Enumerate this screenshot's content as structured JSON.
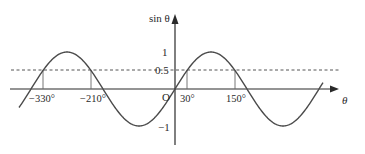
{
  "diagram": {
    "y_axis_label": "sin θ",
    "x_axis_label": "θ",
    "origin_label": "O",
    "y_ticks": [
      {
        "value": 1,
        "label": "1"
      },
      {
        "value": 0.5,
        "label": "0.5"
      },
      {
        "value": -1,
        "label": "−1"
      }
    ],
    "x_markers": [
      {
        "value": -330,
        "label": "−330°"
      },
      {
        "value": -210,
        "label": "−210°"
      },
      {
        "value": 30,
        "label": "30°"
      },
      {
        "value": 150,
        "label": "150°"
      }
    ],
    "reference_line": {
      "y": 0.5,
      "style": "dashed"
    },
    "curve": {
      "function": "sin",
      "domain_deg": [
        -390,
        370
      ]
    },
    "colors": {
      "curve": "#4a4a4a",
      "axes": "#2a2a2a",
      "dashed": "#555555"
    }
  }
}
